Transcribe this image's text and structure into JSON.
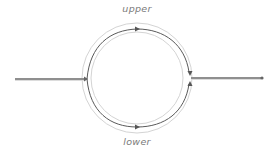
{
  "labels": {
    "upper": "upper",
    "lower": "lower"
  },
  "colors": {
    "path": "#555555",
    "ring": "#cfcfcf",
    "feed_line": "#8a8a8a",
    "label": "#7a7a7a",
    "background": "#ffffff"
  },
  "geometry": {
    "center": [
      137,
      78
    ],
    "ring_outer_radius": 55,
    "ring_inner_radius": 46,
    "path_radius": 50,
    "input_line": {
      "x1": 15,
      "x2": 86,
      "y": 79
    },
    "output_line": {
      "x1": 191,
      "x2": 262,
      "y": 78
    }
  },
  "icons": {
    "upper_arrow": "arrow-right-icon",
    "lower_arrow": "arrow-right-icon",
    "merge_arrow_top": "arrow-down-icon",
    "merge_arrow_bottom": "arrow-up-icon",
    "input_arrow": "arrow-right-icon",
    "output_end": "dot-icon"
  }
}
